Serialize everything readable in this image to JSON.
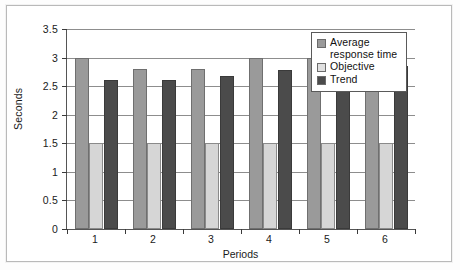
{
  "chart_data": {
    "type": "bar",
    "title": "",
    "subtitle": "",
    "xlabel": "Periods",
    "ylabel": "Seconds",
    "categories": [
      "1",
      "2",
      "3",
      "4",
      "5",
      "6"
    ],
    "series": [
      {
        "name": "Average response time",
        "values": [
          3.0,
          2.8,
          2.8,
          3.0,
          3.0,
          3.15
        ],
        "color": "#9a9a9a"
      },
      {
        "name": "Objective",
        "values": [
          1.5,
          1.5,
          1.5,
          1.5,
          1.5,
          1.5
        ],
        "color": "#d6d6d6"
      },
      {
        "name": "Trend",
        "values": [
          2.6,
          2.6,
          2.68,
          2.78,
          2.78,
          2.85
        ],
        "color": "#4b4b4b"
      }
    ],
    "ylim": [
      0,
      3.5
    ],
    "yticks": [
      "0",
      "0.5",
      "1",
      "1.5",
      "2",
      "2.5",
      "3",
      "3.5"
    ],
    "ytick_values": [
      0,
      0.5,
      1,
      1.5,
      2,
      2.5,
      3,
      3.5
    ],
    "grid": true,
    "grid_axis": "y",
    "legend_position": "top-right-inside",
    "legend_entries": [
      "Average response time",
      "Objective",
      "Trend"
    ]
  },
  "legend": {
    "items": [
      {
        "label": "Average response time"
      },
      {
        "label": "Objective"
      },
      {
        "label": "Trend"
      }
    ]
  },
  "axes": {
    "y_title": "Seconds",
    "x_title": "Periods"
  }
}
